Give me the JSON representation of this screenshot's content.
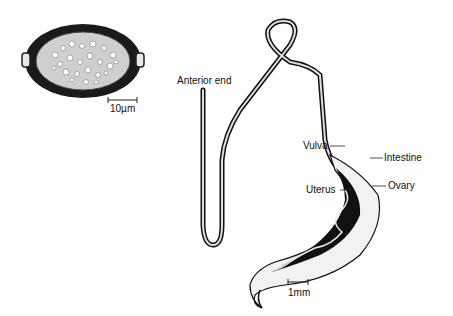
{
  "figure": {
    "egg": {
      "scale_label": "10µm"
    },
    "worm": {
      "labels": {
        "anterior": "Anterior end",
        "vulva": "Vulva",
        "intestine": "Intestine",
        "uterus": "Uterus",
        "ovary": "Ovary"
      },
      "scale_label": "1mm"
    }
  }
}
